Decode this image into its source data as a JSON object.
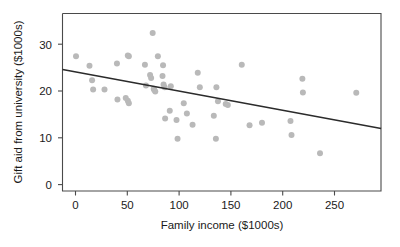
{
  "chart_data": {
    "type": "scatter",
    "title": "",
    "xlabel": "Family income ($1000s)",
    "ylabel": "Gift aid from university ($1000s)",
    "xlim": [
      -12.5,
      295
    ],
    "ylim": [
      -1.5,
      35.5
    ],
    "xticks": [
      0,
      50,
      100,
      150,
      200,
      250
    ],
    "yticks": [
      0,
      10,
      20,
      30
    ],
    "xtick_labels": [
      "0",
      "50",
      "100",
      "150",
      "200",
      "250"
    ],
    "ytick_labels": [
      "0",
      "10",
      "20",
      "30"
    ],
    "grid": false,
    "legend": false,
    "point_color": "#b9b9b9",
    "line_color": "#2b2b2b",
    "frame_color": "#4a4a4a",
    "points": [
      [
        0.5,
        27.4
      ],
      [
        13.5,
        25.4
      ],
      [
        16.0,
        22.3
      ],
      [
        17.0,
        20.3
      ],
      [
        28.0,
        20.3
      ],
      [
        40.0,
        25.9
      ],
      [
        40.5,
        18.2
      ],
      [
        48.5,
        18.5
      ],
      [
        50.5,
        27.6
      ],
      [
        51.5,
        27.4
      ],
      [
        50.5,
        17.9
      ],
      [
        51.5,
        17.4
      ],
      [
        67.0,
        25.6
      ],
      [
        68.0,
        21.2
      ],
      [
        72.0,
        23.4
      ],
      [
        73.0,
        22.8
      ],
      [
        74.5,
        32.4
      ],
      [
        75.5,
        20.5
      ],
      [
        76.0,
        20.2
      ],
      [
        77.0,
        19.9
      ],
      [
        79.5,
        27.4
      ],
      [
        84.0,
        23.2
      ],
      [
        84.5,
        25.5
      ],
      [
        85.0,
        21.4
      ],
      [
        86.0,
        20.8
      ],
      [
        86.5,
        14.1
      ],
      [
        91.0,
        15.8
      ],
      [
        92.0,
        21.0
      ],
      [
        97.5,
        13.8
      ],
      [
        98.5,
        9.8
      ],
      [
        104.5,
        17.4
      ],
      [
        107.5,
        15.2
      ],
      [
        113.0,
        12.8
      ],
      [
        118.0,
        23.9
      ],
      [
        120.0,
        20.8
      ],
      [
        133.5,
        14.7
      ],
      [
        135.5,
        9.8
      ],
      [
        136.0,
        20.8
      ],
      [
        137.5,
        17.8
      ],
      [
        145.0,
        17.2
      ],
      [
        147.0,
        17.0
      ],
      [
        160.5,
        25.6
      ],
      [
        168.0,
        12.7
      ],
      [
        180.0,
        13.2
      ],
      [
        207.5,
        13.6
      ],
      [
        208.5,
        10.6
      ],
      [
        219.0,
        22.6
      ],
      [
        219.5,
        19.7
      ],
      [
        236.0,
        6.7
      ],
      [
        271.0,
        19.6
      ]
    ],
    "trend_line": {
      "x_start": -12.5,
      "y_start": 24.6,
      "x_end": 295.0,
      "y_end": 12.0,
      "slope": -0.0409,
      "intercept": 24.09
    }
  }
}
